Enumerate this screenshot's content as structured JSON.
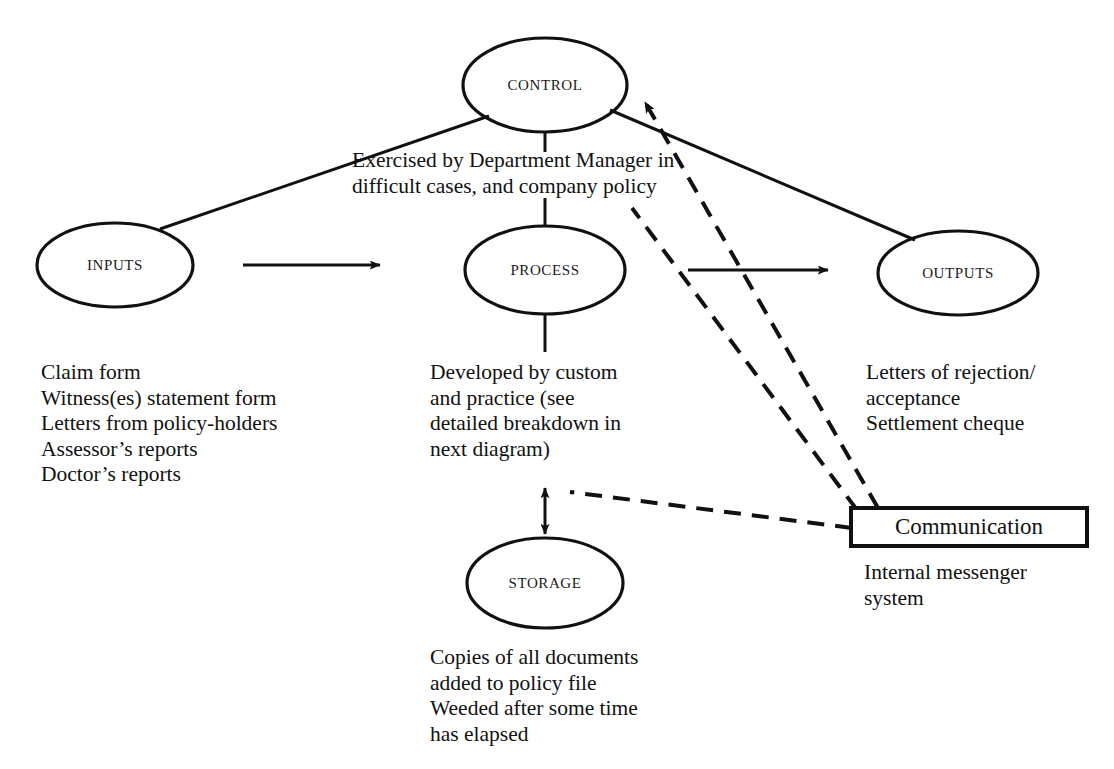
{
  "diagram": {
    "type": "systems-flow-diagram",
    "nodes": [
      {
        "id": "control",
        "label": "CONTROL",
        "shape": "ellipse",
        "cx": 545,
        "cy": 85,
        "rx": 82,
        "ry": 47
      },
      {
        "id": "inputs",
        "label": "INPUTS",
        "shape": "ellipse",
        "cx": 115,
        "cy": 265,
        "rx": 78,
        "ry": 42
      },
      {
        "id": "process",
        "label": "PROCESS",
        "shape": "ellipse",
        "cx": 545,
        "cy": 270,
        "rx": 80,
        "ry": 44
      },
      {
        "id": "outputs",
        "label": "OUTPUTS",
        "shape": "ellipse",
        "cx": 958,
        "cy": 273,
        "rx": 80,
        "ry": 42
      },
      {
        "id": "storage",
        "label": "STORAGE",
        "shape": "ellipse",
        "cx": 545,
        "cy": 583,
        "rx": 78,
        "ry": 45
      },
      {
        "id": "communication",
        "label": "Communication",
        "shape": "rectangle",
        "x": 851,
        "y": 508,
        "w": 236,
        "h": 38
      }
    ],
    "captions": [
      {
        "id": "control-note",
        "text": "Exercised by Department Manager in\ndifficult cases, and company policy",
        "x": 352,
        "y": 148
      },
      {
        "id": "inputs-list",
        "text": "Claim form\nWitness(es) statement form\nLetters from policy-holders\nAssessor’s reports\nDoctor’s reports",
        "x": 41,
        "y": 360
      },
      {
        "id": "process-note",
        "text": "Developed by custom\nand practice (see\ndetailed breakdown in\nnext diagram)",
        "x": 430,
        "y": 360
      },
      {
        "id": "outputs-list",
        "text": "Letters of rejection/\nacceptance\nSettlement cheque",
        "x": 866,
        "y": 360
      },
      {
        "id": "communication-note",
        "text": "Internal messenger\nsystem",
        "x": 864,
        "y": 560
      },
      {
        "id": "storage-note",
        "text": "Copies of all documents\nadded to policy file\nWeeded after some time\nhas elapsed",
        "x": 430,
        "y": 645
      }
    ],
    "connectors": [
      {
        "id": "control-to-inputs",
        "style": "solid",
        "arrow": "none",
        "from": "control",
        "to": "inputs"
      },
      {
        "id": "control-to-outputs",
        "style": "solid",
        "arrow": "none",
        "from": "control",
        "to": "outputs"
      },
      {
        "id": "control-to-process",
        "style": "solid",
        "arrow": "none",
        "from": "control",
        "to": "process"
      },
      {
        "id": "inputs-to-process",
        "style": "solid",
        "arrow": "end",
        "from": "inputs",
        "to": "process"
      },
      {
        "id": "process-to-outputs",
        "style": "solid",
        "arrow": "end",
        "from": "process",
        "to": "outputs"
      },
      {
        "id": "process-to-storage",
        "style": "solid",
        "arrow": "both",
        "from": "process",
        "to": "storage"
      },
      {
        "id": "communication-to-control",
        "style": "dashed",
        "arrow": "end",
        "from": "communication",
        "to": "control"
      },
      {
        "id": "communication-to-process-area",
        "style": "dashed",
        "arrow": "none",
        "from": "communication",
        "to": "process"
      },
      {
        "id": "communication-to-storage-link",
        "style": "dashed",
        "arrow": "none",
        "from": "communication",
        "to": "process"
      }
    ],
    "colors": {
      "ink": "#111111",
      "background": "#ffffff"
    }
  }
}
